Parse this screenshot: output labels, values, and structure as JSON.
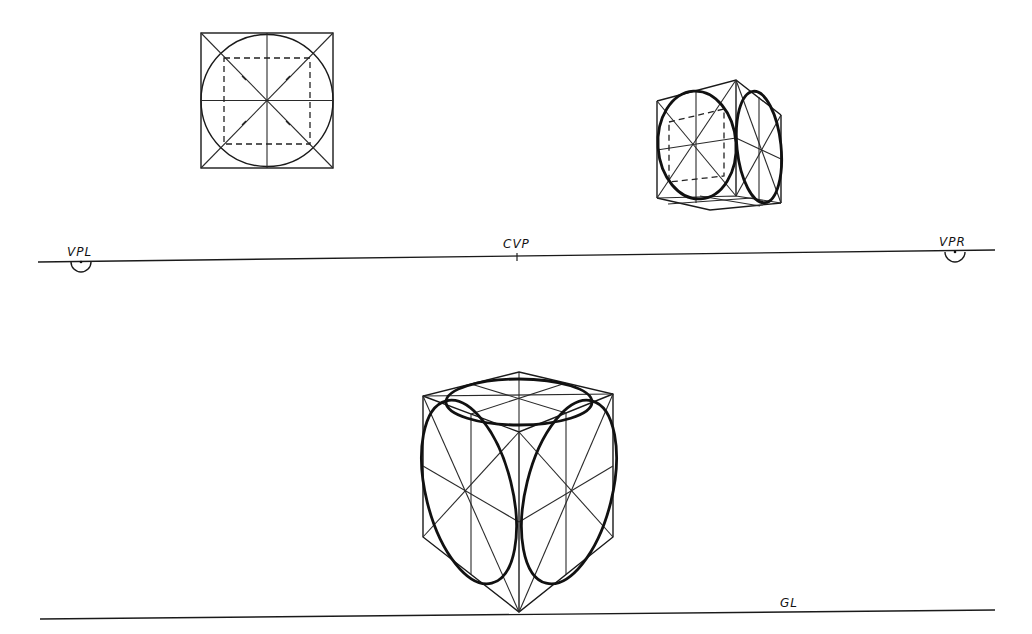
{
  "diagram": {
    "type": "two-point perspective construction of circles in a cube",
    "colors": {
      "ink": "#111111",
      "background": "#ffffff"
    },
    "labels": {
      "vanishing_point_left": "VPL",
      "center_vanishing_point": "CVP",
      "vanishing_point_right": "VPR",
      "ground_line": "GL"
    },
    "elements": [
      {
        "id": "orthographic-square",
        "description": "Square with inscribed circle, diagonals, center lines and dashed inner square"
      },
      {
        "id": "small-cube",
        "description": "Small perspective cube above horizon with ellipses on two visible faces"
      },
      {
        "id": "horizon-line",
        "description": "Horizon line with VPL, CVP, VPR markers"
      },
      {
        "id": "large-cube",
        "description": "Large perspective cube resting on ground line with ellipses on three visible faces"
      },
      {
        "id": "ground-line",
        "description": "Ground line labeled GL"
      }
    ]
  }
}
